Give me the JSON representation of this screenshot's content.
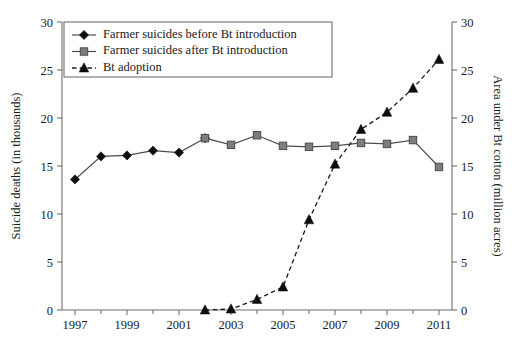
{
  "chart_data": {
    "type": "line",
    "title": "",
    "xlabel": "",
    "x": [
      1997,
      1998,
      1999,
      2000,
      2001,
      2002,
      2003,
      2004,
      2005,
      2006,
      2007,
      2008,
      2009,
      2010,
      2011
    ],
    "xlim": [
      1996.5,
      2011.5
    ],
    "x_tick_values": [
      1997,
      1999,
      2001,
      2003,
      2005,
      2007,
      2009,
      2011
    ],
    "x_tick_labels": [
      "1997",
      "1999",
      "2001",
      "2003",
      "2005",
      "2007",
      "2009",
      "2011"
    ],
    "x_minor_ticks": [
      1998,
      2000,
      2002,
      2004,
      2006,
      2008,
      2010
    ],
    "grid": false,
    "legend_position": "upper-left",
    "axes": [
      {
        "id": "left",
        "label": "Suicide deaths (in thousands)",
        "lim": [
          0,
          30
        ],
        "ticks": [
          0,
          5,
          10,
          15,
          20,
          25,
          30
        ],
        "tick_labels": [
          "0",
          "5",
          "10",
          "15",
          "20",
          "25",
          "30"
        ]
      },
      {
        "id": "right",
        "label": "Area under Bt cotton (million acres)",
        "lim": [
          0,
          30
        ],
        "ticks": [
          0,
          5,
          10,
          15,
          20,
          25,
          30
        ],
        "tick_labels": [
          "0",
          "5",
          "10",
          "15",
          "20",
          "25",
          "30"
        ]
      }
    ],
    "series": [
      {
        "name": "Farmer suicides before Bt introduction",
        "axis": "left",
        "marker": "diamond",
        "line_style": "solid",
        "color": "#0d0d0d",
        "x": [
          1997,
          1998,
          1999,
          2000,
          2001,
          2002
        ],
        "values": [
          13.6,
          16.0,
          16.1,
          16.6,
          16.4,
          17.9
        ]
      },
      {
        "name": "Farmer suicides after Bt introduction",
        "axis": "left",
        "marker": "square",
        "line_style": "solid",
        "color": "#7d7d7d",
        "x": [
          2002,
          2003,
          2004,
          2005,
          2006,
          2007,
          2008,
          2009,
          2010,
          2011
        ],
        "values": [
          17.9,
          17.2,
          18.2,
          17.1,
          17.0,
          17.1,
          17.4,
          17.3,
          17.7,
          14.9
        ]
      },
      {
        "name": "Bt adoption",
        "axis": "right",
        "marker": "triangle",
        "line_style": "dashed",
        "color": "#0d0d0d",
        "x": [
          2002,
          2003,
          2004,
          2005,
          2006,
          2007,
          2008,
          2009,
          2010,
          2011
        ],
        "values": [
          0.0,
          0.1,
          1.1,
          2.4,
          9.4,
          15.2,
          18.8,
          20.6,
          23.1,
          26.1
        ]
      }
    ]
  },
  "legend": {
    "entries": [
      {
        "label": "Farmer suicides before Bt introduction",
        "marker": "diamond",
        "line_style": "solid"
      },
      {
        "label": "Farmer suicides after Bt introduction",
        "marker": "square",
        "line_style": "solid"
      },
      {
        "label": "Bt adoption",
        "marker": "triangle",
        "line_style": "dashed"
      }
    ]
  }
}
